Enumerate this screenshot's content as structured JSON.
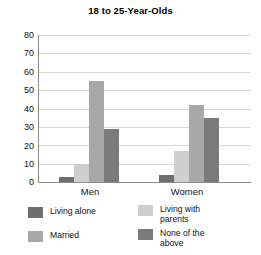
{
  "chart_data": {
    "type": "bar",
    "title": "18 to 25-Year-Olds",
    "xlabel": "",
    "ylabel": "",
    "categories": [
      "Men",
      "Women"
    ],
    "ylim": [
      0,
      80
    ],
    "yticks": [
      0,
      10,
      20,
      30,
      40,
      50,
      60,
      70,
      80
    ],
    "ytick_labels": [
      "0",
      "10",
      "20",
      "30",
      "40",
      "50",
      "60",
      "70",
      "80"
    ],
    "grid": true,
    "legend_position": "bottom",
    "series": [
      {
        "name": "Living alone",
        "color": "#6e6e6e",
        "values": [
          3,
          4
        ]
      },
      {
        "name": "Married",
        "color": "#cfcfcf",
        "values": [
          10,
          17
        ]
      },
      {
        "name": "Living with\nparents",
        "color": "#a8a8a8",
        "values": [
          55,
          42
        ]
      },
      {
        "name": "None of the\nabove",
        "color": "#7a7a7a",
        "values": [
          29,
          35
        ]
      }
    ]
  },
  "axis": {
    "tick_0": "0",
    "tick_1": "10",
    "tick_2": "20",
    "tick_3": "30",
    "tick_4": "40",
    "tick_5": "50",
    "tick_6": "60",
    "tick_7": "70",
    "tick_8": "80"
  },
  "xlabels": {
    "men": "Men",
    "women": "Women"
  },
  "legend": {
    "items": [
      {
        "label": "Living alone"
      },
      {
        "label": "Living with\nparents"
      },
      {
        "label": "Married"
      },
      {
        "label": "None of the\nabove"
      }
    ]
  }
}
